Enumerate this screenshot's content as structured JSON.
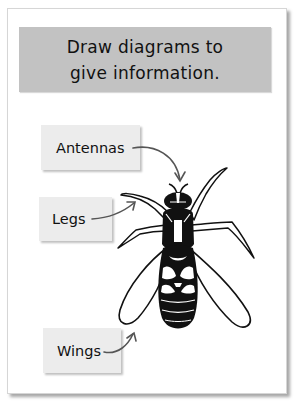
{
  "header": {
    "line1": "Draw diagrams to",
    "line2": "give information."
  },
  "diagram": {
    "labels": [
      {
        "id": "antennas",
        "text": "Antennas"
      },
      {
        "id": "legs",
        "text": "Legs"
      },
      {
        "id": "wings",
        "text": "Wings"
      }
    ]
  },
  "colors": {
    "header_bg": "#c2c2c2",
    "label_bg": "#ececec",
    "arrow": "#555555",
    "ink": "#111111"
  }
}
